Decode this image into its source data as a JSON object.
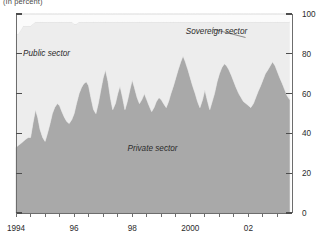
{
  "figure": {
    "units_note": "(In percent)"
  },
  "chart_data": {
    "type": "area",
    "stacked": true,
    "title": "",
    "subtitle": "",
    "units_note": "(In percent)",
    "xlabel": "",
    "ylabel": "",
    "ylim": [
      0,
      100
    ],
    "xlim": [
      1994.0,
      2003.5
    ],
    "y_axis_position": "right",
    "y_ticks": [
      0,
      20,
      40,
      60,
      80,
      100
    ],
    "y_tick_labels": [
      "0",
      "20",
      "40",
      "60",
      "80",
      "100"
    ],
    "x_ticks": [
      1994,
      1994.5,
      1995,
      1995.5,
      1996,
      1996.5,
      1997,
      1997.5,
      1998,
      1998.5,
      1999,
      1999.5,
      2000,
      2000.5,
      2001,
      2001.5,
      2002,
      2002.5,
      2003
    ],
    "x_tick_labels": [
      "1994",
      "",
      "",
      "",
      "96",
      "",
      "",
      "",
      "98",
      "",
      "",
      "",
      "2000",
      "",
      "",
      "",
      "02",
      "",
      ""
    ],
    "x_labeled_ticks": [
      {
        "value": 1994,
        "label": "1994"
      },
      {
        "value": 1996,
        "label": "96"
      },
      {
        "value": 1998,
        "label": "98"
      },
      {
        "value": 2000,
        "label": "2000"
      },
      {
        "value": 2002,
        "label": "02"
      }
    ],
    "grid": false,
    "legend": "inline-annotations",
    "colors": {
      "private_sector": "#a9a9a9",
      "public_sector": "#ededed",
      "sovereign_sector": "#fbfbfb",
      "axis": "#6d6d6d",
      "text": "#2b2b2b"
    },
    "annotations": [
      {
        "name": "public-sector-label",
        "text": "Public sector",
        "x": 1995.05,
        "y": 79
      },
      {
        "name": "private-sector-label",
        "text": "Private sector",
        "x": 1998.7,
        "y": 31
      },
      {
        "name": "sovereign-sector-label",
        "text": "Sovereign sector",
        "x": 2000.9,
        "y": 90,
        "leader_from": [
          2000.75,
          92.5
        ],
        "leader_to": [
          2001.9,
          88.2
        ]
      }
    ],
    "x": [
      1994.0,
      1994.08,
      1994.17,
      1994.25,
      1994.33,
      1994.42,
      1994.5,
      1994.58,
      1994.67,
      1994.75,
      1994.83,
      1994.92,
      1995.0,
      1995.08,
      1995.17,
      1995.25,
      1995.33,
      1995.42,
      1995.5,
      1995.58,
      1995.67,
      1995.75,
      1995.83,
      1995.92,
      1996.0,
      1996.08,
      1996.17,
      1996.25,
      1996.33,
      1996.42,
      1996.5,
      1996.58,
      1996.67,
      1996.75,
      1996.83,
      1996.92,
      1997.0,
      1997.08,
      1997.17,
      1997.25,
      1997.33,
      1997.42,
      1997.5,
      1997.58,
      1997.67,
      1997.75,
      1997.83,
      1997.92,
      1998.0,
      1998.08,
      1998.17,
      1998.25,
      1998.33,
      1998.42,
      1998.5,
      1998.58,
      1998.67,
      1998.75,
      1998.83,
      1998.92,
      1999.0,
      1999.08,
      1999.17,
      1999.25,
      1999.33,
      1999.42,
      1999.5,
      1999.58,
      1999.67,
      1999.75,
      1999.83,
      1999.92,
      2000.0,
      2000.08,
      2000.17,
      2000.25,
      2000.33,
      2000.42,
      2000.5,
      2000.58,
      2000.67,
      2000.75,
      2000.83,
      2000.92,
      2001.0,
      2001.08,
      2001.17,
      2001.25,
      2001.33,
      2001.42,
      2001.5,
      2001.58,
      2001.67,
      2001.75,
      2001.83,
      2001.92,
      2002.0,
      2002.08,
      2002.17,
      2002.25,
      2002.33,
      2002.42,
      2002.5,
      2002.58,
      2002.67,
      2002.75,
      2002.83,
      2002.92,
      2003.0,
      2003.08,
      2003.17,
      2003.25,
      2003.33,
      2003.42
    ],
    "series": [
      {
        "name": "Private sector",
        "key": "private_sector",
        "color": "#a9a9a9",
        "values": [
          33,
          34,
          35,
          36,
          37,
          38,
          38,
          45,
          52,
          48,
          42,
          38,
          36,
          40,
          45,
          50,
          53,
          55,
          54,
          51,
          48,
          46,
          45,
          47,
          50,
          55,
          60,
          63,
          65,
          66,
          64,
          58,
          52,
          50,
          55,
          62,
          68,
          72,
          66,
          58,
          52,
          55,
          60,
          64,
          58,
          52,
          56,
          62,
          67,
          63,
          58,
          55,
          57,
          60,
          57,
          54,
          51,
          53,
          56,
          58,
          57,
          55,
          53,
          56,
          60,
          64,
          68,
          72,
          76,
          79,
          76,
          72,
          68,
          64,
          60,
          56,
          53,
          57,
          62,
          57,
          52,
          56,
          60,
          66,
          70,
          73,
          75,
          74,
          72,
          69,
          66,
          63,
          60,
          58,
          56,
          55,
          54,
          53,
          55,
          58,
          61,
          64,
          67,
          70,
          72,
          74,
          76,
          74,
          71,
          68,
          65,
          62,
          59,
          57
        ]
      },
      {
        "name": "Public sector",
        "key": "public_sector",
        "color": "#ededed",
        "values": [
          57,
          56,
          57,
          58,
          57,
          56,
          56,
          50,
          44,
          48,
          54,
          58,
          60,
          56,
          51,
          46,
          43,
          41,
          42,
          45,
          48,
          50,
          51,
          49,
          45,
          40,
          36,
          33,
          31,
          30,
          32,
          38,
          44,
          46,
          41,
          34,
          28,
          24,
          30,
          38,
          44,
          41,
          36,
          32,
          38,
          44,
          40,
          34,
          29,
          33,
          38,
          41,
          39,
          36,
          39,
          42,
          45,
          43,
          40,
          38,
          39,
          41,
          43,
          40,
          36,
          32,
          28,
          24,
          20,
          17,
          20,
          24,
          28,
          32,
          36,
          40,
          43,
          39,
          34,
          39,
          44,
          40,
          36,
          30,
          26,
          23,
          21,
          22,
          24,
          27,
          30,
          33,
          36,
          38,
          40,
          41,
          42,
          43,
          41,
          38,
          35,
          32,
          29,
          26,
          24,
          22,
          20,
          22,
          25,
          28,
          31,
          34,
          37,
          39
        ]
      },
      {
        "name": "Sovereign sector",
        "key": "sovereign_sector",
        "color": "#fbfbfb",
        "values": [
          10,
          10,
          8,
          6,
          6,
          6,
          6,
          5,
          4,
          4,
          4,
          4,
          4,
          4,
          4,
          4,
          4,
          4,
          4,
          4,
          4,
          4,
          4,
          4,
          5,
          5,
          4,
          4,
          4,
          4,
          4,
          4,
          4,
          4,
          4,
          4,
          4,
          4,
          4,
          4,
          4,
          4,
          4,
          4,
          4,
          4,
          4,
          4,
          4,
          4,
          4,
          4,
          4,
          4,
          4,
          4,
          4,
          4,
          4,
          4,
          4,
          4,
          4,
          4,
          4,
          4,
          4,
          4,
          4,
          4,
          4,
          4,
          4,
          4,
          4,
          4,
          4,
          4,
          4,
          4,
          4,
          4,
          4,
          4,
          4,
          4,
          4,
          4,
          4,
          4,
          4,
          4,
          4,
          4,
          4,
          4,
          4,
          4,
          4,
          4,
          4,
          4,
          4,
          4,
          4,
          4,
          4,
          4,
          4,
          4,
          4,
          4,
          4,
          4
        ]
      }
    ]
  }
}
